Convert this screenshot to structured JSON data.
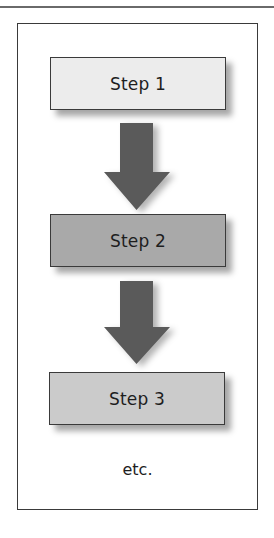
{
  "diagram": {
    "type": "flowchart",
    "direction": "top-to-bottom",
    "steps": [
      {
        "label": "Step 1",
        "fill": "#ececec"
      },
      {
        "label": "Step 2",
        "fill": "#a9a9a9"
      },
      {
        "label": "Step 3",
        "fill": "#cbcbcb"
      }
    ],
    "continuation_label": "etc.",
    "arrow_color": "#5a5a5a",
    "arrow_icon": "down-arrow-icon"
  }
}
